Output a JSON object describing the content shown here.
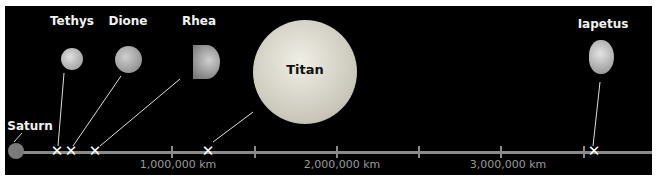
{
  "diagram": {
    "planet": {
      "name": "Saturn",
      "color": "#7a7a7a"
    },
    "moons": [
      {
        "name": "Tethys",
        "distance_km": 294619
      },
      {
        "name": "Dione",
        "distance_km": 377396
      },
      {
        "name": "Rhea",
        "distance_km": 527108
      },
      {
        "name": "Titan",
        "distance_km": 1221870
      },
      {
        "name": "Iapetus",
        "distance_km": 3560820
      }
    ],
    "axis": {
      "tick_labels": [
        "1,000,000 km",
        "2,000,000 km",
        "3,000,000 km"
      ],
      "tick_interval_km": 500000,
      "color": "#8a8a8a"
    },
    "background": "#000000"
  }
}
